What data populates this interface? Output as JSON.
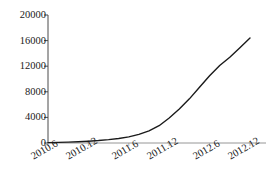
{
  "chart_data": {
    "type": "line",
    "title": "",
    "subtitle": "",
    "xlabel": "",
    "ylabel": "",
    "legend": [],
    "legend_position": "none",
    "grid": false,
    "xlim": [
      0,
      5
    ],
    "ylim": [
      0,
      20000
    ],
    "categories": [
      "2010.6",
      "2010.12",
      "2011.6",
      "2011.12",
      "2012.6",
      "2012.12"
    ],
    "yticks": [
      0,
      4000,
      8000,
      12000,
      16000,
      20000
    ],
    "ytick_labels": [
      "0",
      "4000",
      "8000",
      "12000",
      "16000",
      "20000"
    ],
    "xtick_labels": [
      "2010.6",
      "2010.12",
      "2011.6",
      "2011.12",
      "2012.6",
      "2012.12"
    ],
    "series": [
      {
        "name": "value",
        "color": "#1a1a1a",
        "line_width": 1.4,
        "marker": "none",
        "x": [
          0,
          0.25,
          0.5,
          0.75,
          1,
          1.25,
          1.5,
          1.75,
          2,
          2.25,
          2.5,
          2.75,
          3,
          3.25,
          3.5,
          3.75,
          4,
          4.25,
          4.5,
          4.75,
          5
        ],
        "values": [
          60,
          90,
          130,
          190,
          280,
          380,
          520,
          700,
          950,
          1350,
          1900,
          2700,
          3900,
          5300,
          6900,
          8700,
          10500,
          12100,
          13400,
          14900,
          16400
        ]
      }
    ],
    "annotations": []
  },
  "axis": {
    "y_axis_name": "y-axis",
    "x_axis_name": "x-axis",
    "tick_color": "#1a1a1a",
    "axis_color": "#4a4a4a"
  }
}
